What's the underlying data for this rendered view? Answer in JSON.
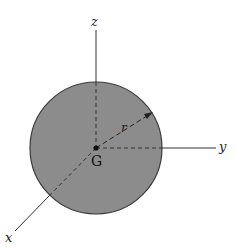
{
  "diagram": {
    "type": "solid sphere with coordinate axes",
    "colors": {
      "sphere_fill": "#8c8c8c",
      "sphere_edge": "#3a3a3a",
      "axis": "#333333",
      "background": "#ffffff"
    },
    "labels": {
      "z_axis": "z",
      "y_axis": "y",
      "x_axis": "x",
      "radius": "r",
      "center": "G"
    }
  }
}
